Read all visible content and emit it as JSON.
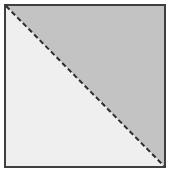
{
  "figure": {
    "title": "Square divided by a dashed diagonal",
    "canvas": {
      "width": 171,
      "height": 174,
      "background_color": "#ffffff"
    },
    "square": {
      "name": "square-outline",
      "x": 5,
      "y": 5,
      "width": 160,
      "height": 162,
      "border_color": "#3f3f3f",
      "border_width": 2
    },
    "regions": [
      {
        "name": "upper-right-triangle",
        "label": "Upper right triangle",
        "fill_color": "#c3c3c3",
        "points": "6,6 164,6 164,166"
      },
      {
        "name": "lower-left-triangle",
        "label": "Lower left triangle",
        "fill_color": "#efefef",
        "points": "6,6 164,166 6,166"
      }
    ],
    "diagonal": {
      "name": "dashed-diagonal-line",
      "label": "Dashed diagonal",
      "x1": 6,
      "y1": 6,
      "x2": 164,
      "y2": 166,
      "stroke_color": "#2e2e2e",
      "stroke_width": 2,
      "dash_pattern": "5 3"
    }
  }
}
